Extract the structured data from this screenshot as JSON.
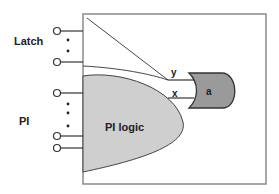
{
  "diagram": {
    "labels": {
      "latch": "Latch",
      "pi": "PI",
      "pi_logic": "PI logic",
      "signal_y": "y",
      "signal_x": "x",
      "gate": "a"
    },
    "colors": {
      "box_border": "#8a8a8a",
      "pi_logic_fill": "#cfcfcf",
      "gate_fill": "#9a9a9a",
      "line": "#333333"
    },
    "inputs": {
      "latch_pins": 2,
      "pi_pins": 3
    }
  }
}
